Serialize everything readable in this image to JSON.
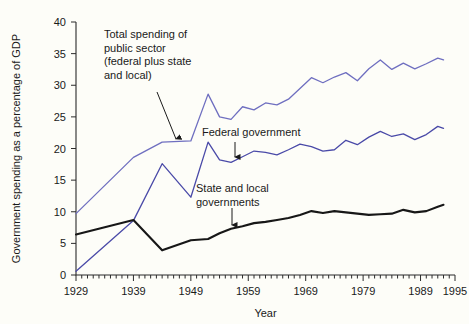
{
  "chart_data": {
    "type": "line",
    "title": "",
    "xlabel": "Year",
    "ylabel": "Government spending as a percentage of GDP",
    "xlim": [
      1929,
      1995
    ],
    "ylim": [
      0,
      40
    ],
    "ytick_values": [
      0,
      5,
      10,
      15,
      20,
      25,
      30,
      35,
      40
    ],
    "ytick_labels": [
      "0",
      "5",
      "10",
      "15",
      "20",
      "25",
      "30",
      "35",
      "40"
    ],
    "xtick_labels": [
      "1929",
      "1939",
      "1949",
      "1959",
      "1969",
      "1979",
      "1989",
      "1995"
    ],
    "xtick_values": [
      1929,
      1939,
      1949,
      1959,
      1969,
      1979,
      1989,
      1995
    ],
    "minor_xtick_step": 1,
    "grid": false,
    "legend_position": "inline-annotations",
    "series": [
      {
        "name": "Total spending of public sector (federal plus state and local)",
        "color": "#6f6fc0",
        "x": [
          1929,
          1939,
          1944,
          1949,
          1952,
          1954,
          1956,
          1958,
          1960,
          1962,
          1964,
          1966,
          1968,
          1970,
          1972,
          1974,
          1976,
          1978,
          1980,
          1982,
          1984,
          1986,
          1988,
          1990,
          1992,
          1993
        ],
        "values": [
          9.7,
          18.6,
          21.0,
          21.2,
          28.6,
          25.0,
          24.6,
          26.6,
          26.1,
          27.2,
          26.9,
          27.8,
          29.5,
          31.2,
          30.4,
          31.3,
          32.0,
          30.7,
          32.6,
          34.0,
          32.5,
          33.5,
          32.6,
          33.4,
          34.3,
          34.0
        ]
      },
      {
        "name": "Federal government",
        "color": "#4a4aa8",
        "x": [
          1929,
          1939,
          1944,
          1949,
          1952,
          1954,
          1956,
          1958,
          1960,
          1962,
          1964,
          1966,
          1968,
          1970,
          1972,
          1974,
          1976,
          1978,
          1980,
          1982,
          1984,
          1986,
          1988,
          1990,
          1992,
          1993
        ],
        "values": [
          0.6,
          8.6,
          17.6,
          12.3,
          21.0,
          18.2,
          17.8,
          18.7,
          19.6,
          19.4,
          19.0,
          19.8,
          20.7,
          20.3,
          19.6,
          19.8,
          21.3,
          20.6,
          21.8,
          22.7,
          21.9,
          22.3,
          21.4,
          22.2,
          23.5,
          23.2
        ]
      },
      {
        "name": "State and local governments",
        "color": "#171717",
        "x": [
          1929,
          1939,
          1944,
          1949,
          1952,
          1954,
          1956,
          1958,
          1960,
          1962,
          1964,
          1966,
          1968,
          1970,
          1972,
          1974,
          1976,
          1978,
          1980,
          1982,
          1984,
          1986,
          1988,
          1990,
          1992,
          1993
        ],
        "values": [
          6.4,
          8.7,
          3.9,
          5.5,
          5.7,
          6.6,
          7.3,
          7.7,
          8.2,
          8.4,
          8.7,
          9.0,
          9.5,
          10.1,
          9.8,
          10.1,
          9.9,
          9.7,
          9.5,
          9.6,
          9.7,
          10.3,
          9.9,
          10.1,
          10.8,
          11.1
        ]
      }
    ],
    "annotations": [
      {
        "id": "total-spending",
        "lines": [
          "Total spending of",
          "public sector",
          "(federal plus state",
          "and local)"
        ],
        "text": "Total spending of public sector (federal plus state and local)",
        "text_x": 104,
        "text_y": 38,
        "arrow_from_x": 157,
        "arrow_from_y": 92,
        "arrow_to_x": 176,
        "arrow_to_y": 145
      },
      {
        "id": "federal-government",
        "lines": [
          "Federal government"
        ],
        "text": "Federal government",
        "text_x": 202,
        "text_y": 136,
        "arrow_from_x": 235,
        "arrow_from_y": 142,
        "arrow_to_x": 235,
        "arrow_to_y": 163
      },
      {
        "id": "state-and-local",
        "lines": [
          "State and local",
          "governments"
        ],
        "text": "State and local governments",
        "text_x": 196,
        "text_y": 192,
        "arrow_from_x": 232,
        "arrow_from_y": 208,
        "arrow_to_x": 232,
        "arrow_to_y": 231
      }
    ]
  }
}
